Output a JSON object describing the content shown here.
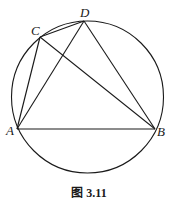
{
  "figure": {
    "caption": "图 3.11",
    "points": {
      "A": {
        "label": "A"
      },
      "B": {
        "label": "B"
      },
      "C": {
        "label": "C"
      },
      "D": {
        "label": "D"
      }
    },
    "segments": [
      [
        "A",
        "B"
      ],
      [
        "A",
        "C"
      ],
      [
        "A",
        "D"
      ],
      [
        "C",
        "D"
      ],
      [
        "C",
        "B"
      ],
      [
        "D",
        "B"
      ]
    ],
    "circle": "circumcircle through A, B, C, D"
  }
}
